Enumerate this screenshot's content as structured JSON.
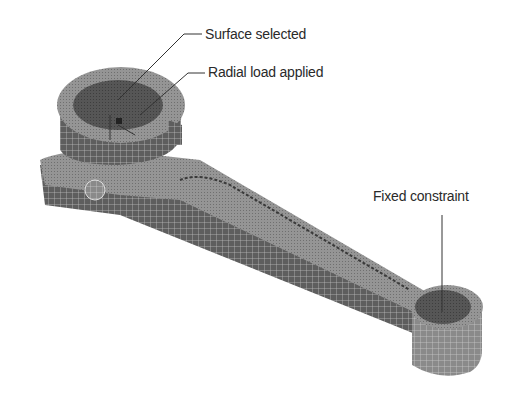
{
  "figure": {
    "annotations": [
      {
        "id": "surface",
        "text": "Surface selected"
      },
      {
        "id": "radial",
        "text": "Radial load applied"
      },
      {
        "id": "fixed",
        "text": "Fixed constraint"
      }
    ]
  },
  "colors": {
    "background": "#ffffff",
    "mesh_light": "#9a9a9a",
    "mesh_mid": "#7d7d7d",
    "mesh_dark": "#5a5a5a",
    "selected_surface": "#555555",
    "leader_line": "#333333",
    "text": "#2a2a2a"
  }
}
